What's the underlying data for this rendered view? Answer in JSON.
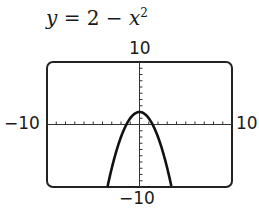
{
  "title": {
    "lhs": "y",
    "eq": " = 2 − ",
    "var": "x",
    "exp": "2"
  },
  "labels": {
    "ymax": "10",
    "ymin": "−10",
    "xmin": "−10",
    "xmax": "10"
  },
  "chart_data": {
    "type": "line",
    "xlabel": "",
    "ylabel": "",
    "xlim": [
      -10,
      10
    ],
    "ylim": [
      -10,
      10
    ],
    "xscale_tick": 1,
    "yscale_tick": 1,
    "grid": false,
    "series": [
      {
        "name": "y = 2 - x^2",
        "x": [
          -3.46,
          -3,
          -2,
          -1,
          0,
          1,
          2,
          3,
          3.46
        ],
        "y": [
          -10,
          -7,
          -2,
          1,
          2,
          1,
          -2,
          -7,
          -10
        ]
      }
    ]
  }
}
